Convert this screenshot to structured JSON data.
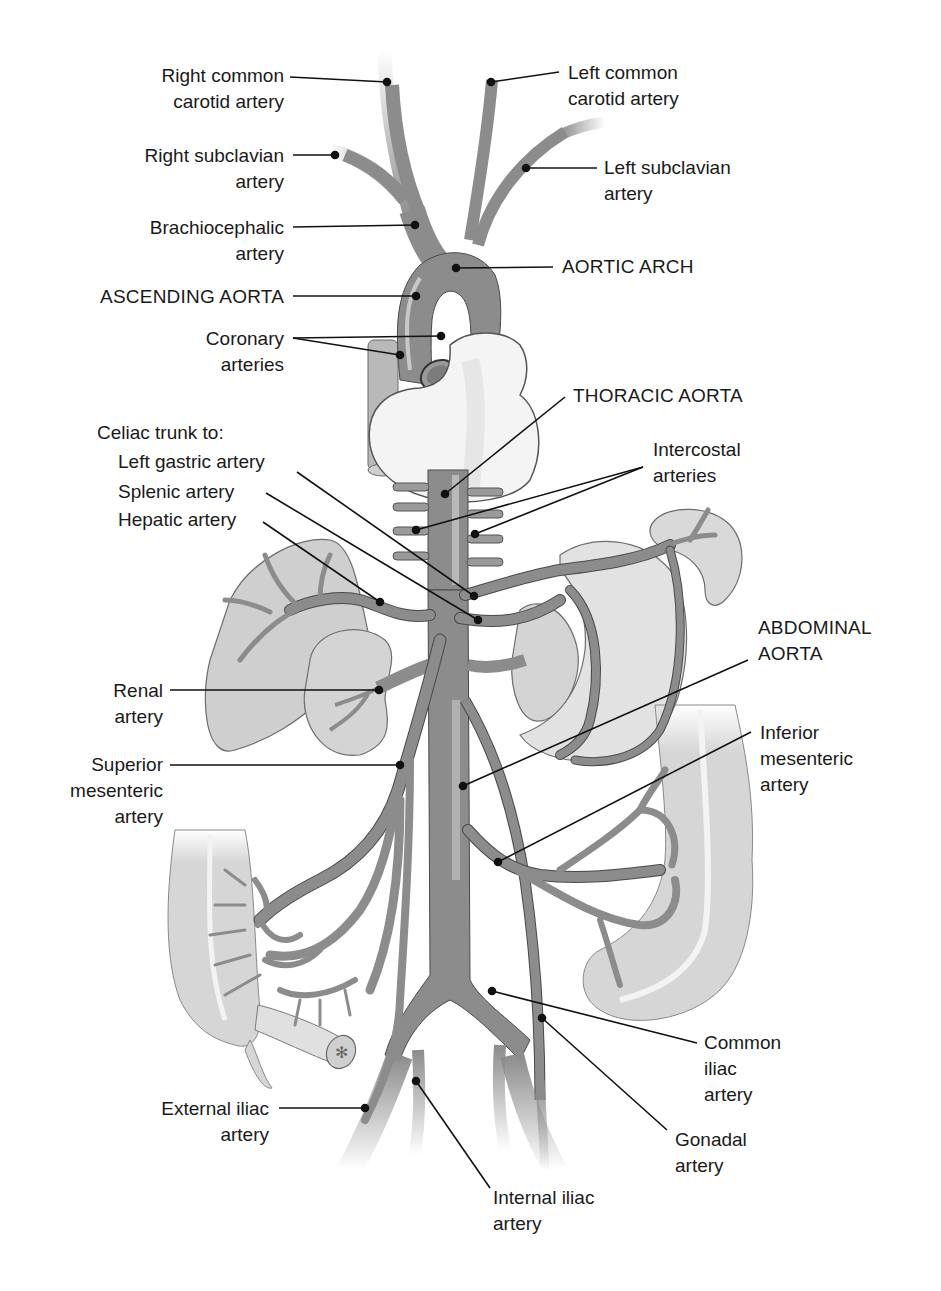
{
  "diagram": {
    "type": "anatomical-illustration",
    "colors": {
      "background": "#ffffff",
      "artery_fill": "#8c8c8c",
      "artery_outline": "#4a4a4a",
      "artery_highlight": "#bdbdbd",
      "organ_fill": "#d9d9d9",
      "organ_outline": "#6e6e6e",
      "heart_fill": "#f4f4f4",
      "leader_line": "#111111",
      "text": "#1a1a1a"
    }
  },
  "labels": {
    "right_common_carotid": [
      "Right common",
      "carotid artery"
    ],
    "left_common_carotid": [
      "Left common",
      "carotid artery"
    ],
    "right_subclavian": [
      "Right subclavian",
      "artery"
    ],
    "left_subclavian": [
      "Left subclavian",
      "artery"
    ],
    "brachiocephalic": [
      "Brachiocephalic",
      "artery"
    ],
    "aortic_arch": [
      "AORTIC ARCH"
    ],
    "ascending_aorta": [
      "ASCENDING AORTA"
    ],
    "coronary": [
      "Coronary",
      "arteries"
    ],
    "thoracic_aorta": [
      "THORACIC AORTA"
    ],
    "celiac_trunk": [
      "Celiac trunk to:"
    ],
    "left_gastric": [
      "Left gastric artery"
    ],
    "splenic": [
      "Splenic artery"
    ],
    "hepatic": [
      "Hepatic artery"
    ],
    "intercostal": [
      "Intercostal",
      "arteries"
    ],
    "abdominal_aorta": [
      "ABDOMINAL",
      "AORTA"
    ],
    "renal": [
      "Renal",
      "artery"
    ],
    "superior_mesenteric": [
      "Superior",
      "mesenteric",
      "artery"
    ],
    "inferior_mesenteric": [
      "Inferior",
      "mesenteric",
      "artery"
    ],
    "common_iliac": [
      "Common",
      "iliac",
      "artery"
    ],
    "gonadal": [
      "Gonadal",
      "artery"
    ],
    "external_iliac": [
      "External iliac",
      "artery"
    ],
    "internal_iliac": [
      "Internal iliac",
      "artery"
    ]
  }
}
